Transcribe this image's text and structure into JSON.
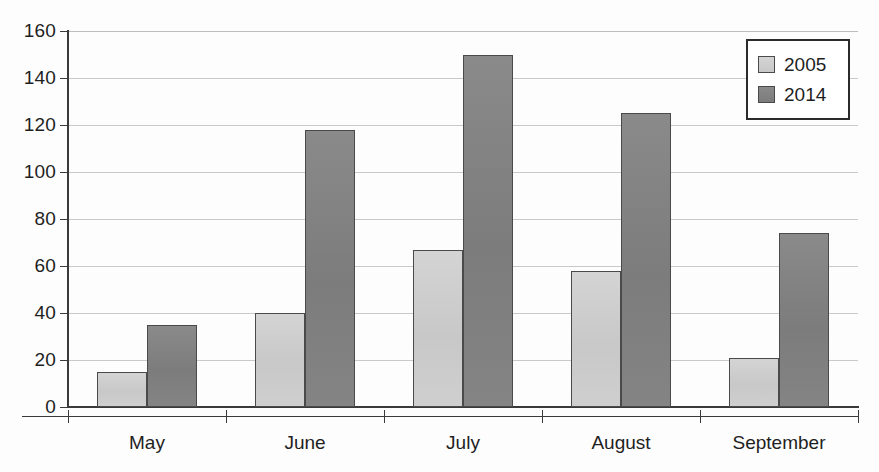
{
  "chart_data": {
    "type": "bar",
    "title": "",
    "subtitle": "",
    "xlabel": "",
    "ylabel": "",
    "categories": [
      "May",
      "June",
      "July",
      "August",
      "September"
    ],
    "series": [
      {
        "name": "2005",
        "color": "#cdcdcd",
        "values": [
          15,
          40,
          67,
          58,
          21
        ]
      },
      {
        "name": "2014",
        "color": "#808080",
        "values": [
          35,
          118,
          150,
          125,
          74
        ]
      }
    ],
    "ylim": [
      0,
      160
    ],
    "ytick_step": 20,
    "yticks": [
      0,
      20,
      40,
      60,
      80,
      100,
      120,
      140,
      160
    ],
    "ytick_labels": [
      "0",
      "20",
      "40",
      "60",
      "80",
      "100",
      "120",
      "140",
      "160"
    ],
    "grid": true,
    "grid_axis": "y",
    "legend": true,
    "legend_position": "top-right",
    "legend_entries": [
      "2005",
      "2014"
    ],
    "bar_mode": "grouped"
  },
  "legend": {
    "entries": [
      {
        "label": "2005",
        "swatch": "legend-swatch-2005"
      },
      {
        "label": "2014",
        "swatch": "legend-swatch-2014"
      }
    ]
  }
}
